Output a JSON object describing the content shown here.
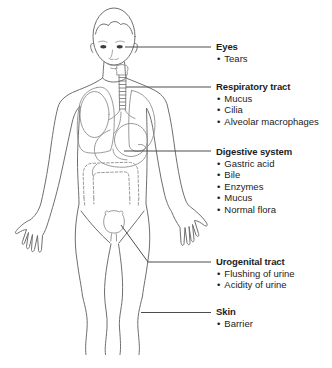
{
  "bullet": "•",
  "sections": [
    {
      "id": "eyes",
      "title": "Eyes",
      "items": [
        "Tears"
      ]
    },
    {
      "id": "respiratory-tract",
      "title": "Respiratory tract",
      "items": [
        "Mucus",
        "Cilia",
        "Alveolar macrophages"
      ]
    },
    {
      "id": "digestive-system",
      "title": "Digestive system",
      "items": [
        "Gastric acid",
        "Bile",
        "Enzymes",
        "Mucus",
        "Normal flora"
      ]
    },
    {
      "id": "urogenital-tract",
      "title": "Urogenital tract",
      "items": [
        "Flushing of urine",
        "Acidity of urine"
      ]
    },
    {
      "id": "skin",
      "title": "Skin",
      "items": [
        "Barrier"
      ]
    }
  ],
  "colors": {
    "outline": "#6f6f6f",
    "organ": "#8e8e8e",
    "leader": "#4d4d4d",
    "text": "#1c1c1c",
    "eye": "#3c3c3c",
    "background": "#ffffff"
  }
}
